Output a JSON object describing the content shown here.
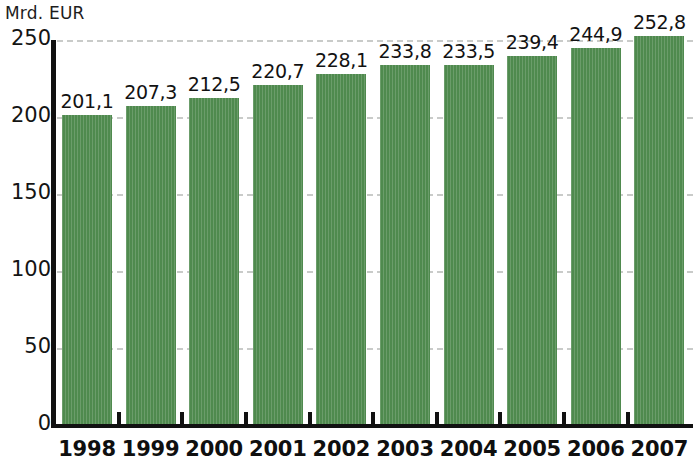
{
  "chart_data": {
    "type": "bar",
    "title": "",
    "subtitle": "",
    "unit_label": "Mrd. EUR",
    "xlabel": "",
    "ylabel": "Mrd. EUR",
    "ylim": [
      0,
      250
    ],
    "y_ticks": [
      "0",
      "50",
      "100",
      "150",
      "200",
      "250"
    ],
    "y_tick_values": [
      0,
      50,
      100,
      150,
      200,
      250
    ],
    "grid": true,
    "grid_style": "dashed-horizontal",
    "legend": "none",
    "categories": [
      "1998",
      "1999",
      "2000",
      "2001",
      "2002",
      "2003",
      "2004",
      "2005",
      "2006",
      "2007"
    ],
    "values": [
      201.1,
      207.3,
      212.5,
      220.7,
      228.1,
      233.8,
      233.5,
      239.4,
      244.9,
      252.8
    ],
    "value_labels": [
      "201,1",
      "207,3",
      "212,5",
      "220,7",
      "228,1",
      "233,8",
      "233,5",
      "239,4",
      "244,9",
      "252,8"
    ],
    "bar_color": "#4f8a4e",
    "axis_color": "#111111",
    "grid_color": "#c9cbc9",
    "text_color": "#121212"
  }
}
